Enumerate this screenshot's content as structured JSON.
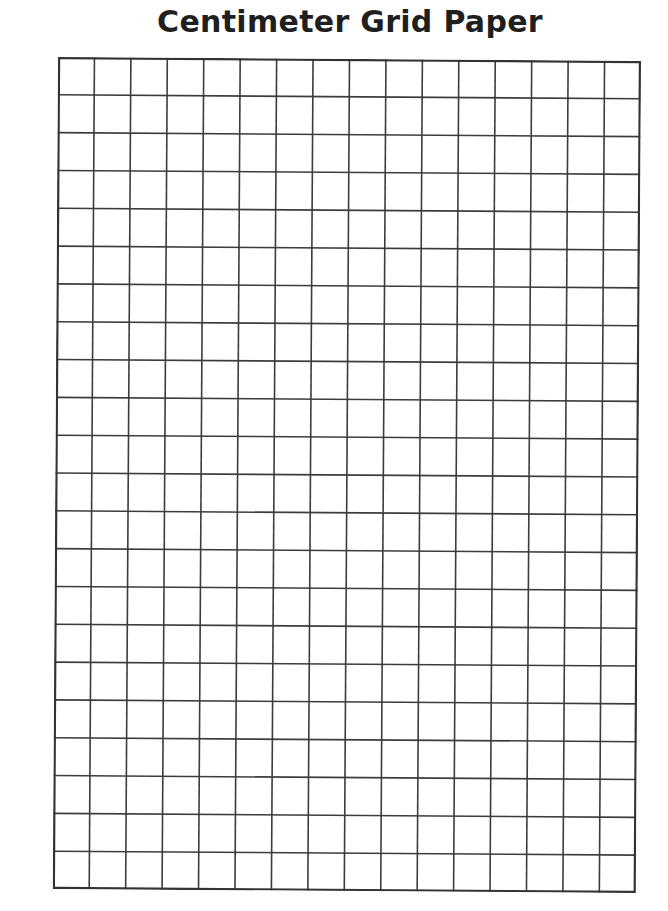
{
  "page": {
    "title": "Centimeter Grid Paper"
  },
  "grid": {
    "columns": 16,
    "rows": 22,
    "line_color": "#3c3c3c",
    "border_color": "#333333",
    "background": "#ffffff"
  }
}
